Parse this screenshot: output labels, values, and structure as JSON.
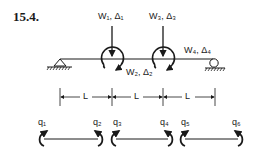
{
  "problem_number": "15.4.",
  "loads": [
    {
      "id": "1",
      "label": "W₁, Δ₁"
    },
    {
      "id": "2",
      "label": "W₂, Δ₂"
    },
    {
      "id": "3",
      "label": "W₃, Δ₃"
    },
    {
      "id": "4",
      "label": "W₄, Δ₄"
    }
  ],
  "spans": [
    {
      "label": "L"
    },
    {
      "label": "L"
    },
    {
      "label": "L"
    }
  ],
  "element_dofs": [
    {
      "label": "q₁"
    },
    {
      "label": "q₂"
    },
    {
      "label": "q₃"
    },
    {
      "label": "q₄"
    },
    {
      "label": "q₅"
    },
    {
      "label": "q₆"
    }
  ],
  "supports": {
    "left": "pin-support",
    "right": "roller-support"
  },
  "colors": {
    "ink": "#1a1a1a",
    "background": "#ffffff"
  }
}
